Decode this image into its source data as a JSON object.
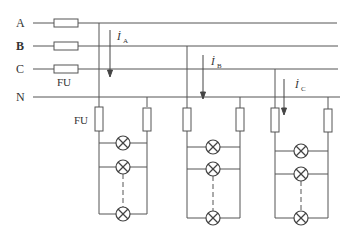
{
  "diagram": {
    "lines": [
      {
        "label": "A",
        "y": 23
      },
      {
        "label": "B",
        "y": 46
      },
      {
        "label": "C",
        "y": 69
      },
      {
        "label": "N",
        "y": 97
      }
    ],
    "line_fuse_label": "FU",
    "load_fuse_label": "FU",
    "currents": [
      {
        "symbol": "İ",
        "sub": "A"
      },
      {
        "symbol": "İ",
        "sub": "B"
      },
      {
        "symbol": "İ",
        "sub": "C"
      }
    ],
    "loads": [
      {
        "phase": "A",
        "lamps_visible": 3,
        "note": "lamps in parallel, dashed = more lamps"
      },
      {
        "phase": "B",
        "lamps_visible": 3,
        "note": "lamps in parallel, dashed = more lamps"
      },
      {
        "phase": "C",
        "lamps_visible": 3,
        "note": "lamps in parallel, dashed = more lamps"
      }
    ],
    "colors": {
      "stroke": "#555555",
      "text": "#333333"
    }
  }
}
